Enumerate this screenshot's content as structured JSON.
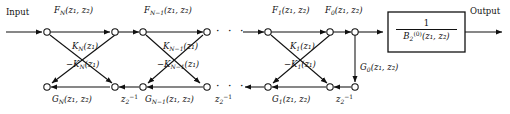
{
  "diagram": {
    "io": {
      "input_label": "Input",
      "output_label": "Output"
    },
    "block": {
      "numerator": "1",
      "denominator_base": "B",
      "denominator_sub": "2",
      "denominator_sup": "(0)",
      "denominator_args": "(z₁, z₂)"
    },
    "stages": [
      {
        "id": "stage-N",
        "forward_label": "F",
        "forward_sub": "N",
        "forward_args": "(z₁, z₂)",
        "backward_label": "G",
        "backward_sub": "N",
        "backward_args": "(z₁, z₂)",
        "coef_pos": "K",
        "coef_pos_sub": "N",
        "coef_args": "(z₁)",
        "coef_neg": "−K",
        "delay": "z",
        "delay_sub": "2",
        "delay_sup": "−1"
      },
      {
        "id": "stage-N-1",
        "forward_label": "F",
        "forward_sub": "N−1",
        "forward_args": "(z₁, z₂)",
        "backward_label": "G",
        "backward_sub": "N−1",
        "backward_args": "(z₁, z₂)",
        "coef_pos": "K",
        "coef_pos_sub": "N−1",
        "coef_args": "(z₁)",
        "coef_neg": "−K",
        "delay": "z",
        "delay_sub": "2",
        "delay_sup": "−1"
      },
      {
        "id": "stage-1",
        "forward_label": "F",
        "forward_sub": "1",
        "forward_args": "(z₁, z₂)",
        "backward_label": "G",
        "backward_sub": "1",
        "backward_args": "(z₁, z₂)",
        "coef_pos": "K",
        "coef_pos_sub": "1",
        "coef_args": "(z₁)",
        "coef_neg": "−K",
        "delay": "z",
        "delay_sub": "2",
        "delay_sup": "−1"
      },
      {
        "id": "stage-0",
        "forward_label": "F",
        "forward_sub": "0",
        "forward_args": "(z₁, z₂)",
        "backward_label": "G",
        "backward_sub": "0",
        "backward_args": "(z₁, z₂)"
      }
    ],
    "ellipsis": "· · ·",
    "colors": {
      "line": "#111111",
      "background": "#ffffff"
    }
  }
}
